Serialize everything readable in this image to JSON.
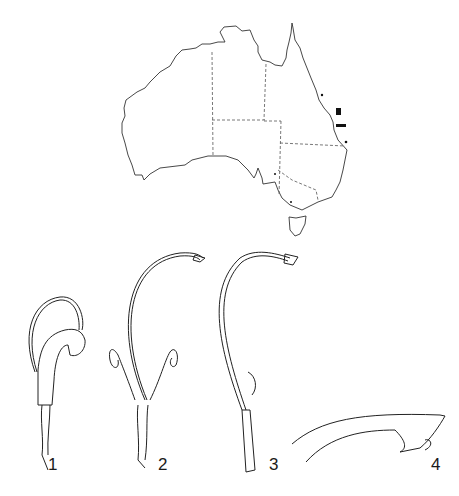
{
  "figure": {
    "map": {
      "region": "Australia",
      "state_boundaries": "dashed",
      "distribution_marks": "east coast Queensland"
    },
    "panels": [
      {
        "label": "1",
        "x": 48,
        "y": 467
      },
      {
        "label": "2",
        "x": 158,
        "y": 467
      },
      {
        "label": "3",
        "x": 269,
        "y": 467
      },
      {
        "label": "4",
        "x": 431,
        "y": 467
      }
    ],
    "colors": {
      "ink": "#1a1a1a",
      "background": "#ffffff"
    }
  }
}
